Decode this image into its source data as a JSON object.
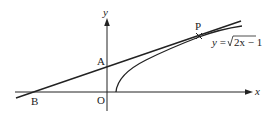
{
  "diagram": {
    "axes": {
      "x_label": "x",
      "y_label": "y",
      "origin_label": "O"
    },
    "points": {
      "A": "A",
      "B": "B",
      "P": "P"
    },
    "curve_label": {
      "lhs": "y = ",
      "radicand": "2x − 1"
    },
    "colors": {
      "ink": "#222222",
      "background": "#ffffff"
    }
  }
}
